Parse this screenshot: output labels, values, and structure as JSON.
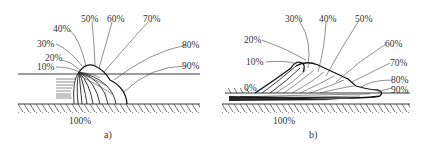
{
  "figures": [
    {
      "id": "a",
      "caption": "a)",
      "labels": {
        "p10": "10%",
        "p20": "20%",
        "p30": "30%",
        "p40": "40%",
        "p50": "50%",
        "p60": "60%",
        "p70": "70%",
        "p80": "80%",
        "p90": "90%",
        "p100": "100%"
      }
    },
    {
      "id": "b",
      "caption": "b)",
      "labels": {
        "p0": "0%",
        "p10": "10%",
        "p20": "20%",
        "p30": "30%",
        "p40": "40%",
        "p50": "50%",
        "p60": "60%",
        "p70": "70%",
        "p80": "80%",
        "p90": "90%",
        "p100": "100%"
      }
    }
  ]
}
